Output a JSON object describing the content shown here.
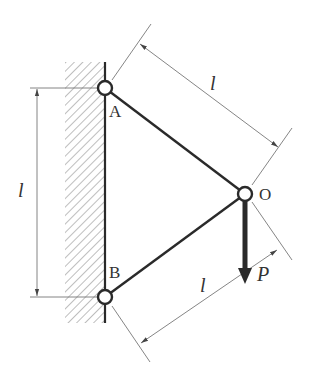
{
  "diagram": {
    "colors": {
      "member": "#2a2a2a",
      "dimension": "#777777",
      "hatch": "#888888",
      "text": "#333333",
      "background": "#ffffff"
    },
    "joints": [
      {
        "id": "A",
        "label": "A",
        "x": 105,
        "y": 88
      },
      {
        "id": "B",
        "label": "B",
        "x": 105,
        "y": 297
      },
      {
        "id": "O",
        "label": "O",
        "x": 245,
        "y": 194
      }
    ],
    "members": [
      {
        "from": "A",
        "to": "O"
      },
      {
        "from": "B",
        "to": "O"
      }
    ],
    "load": {
      "label": "P",
      "at": "O",
      "direction": "down"
    },
    "dimensions": [
      {
        "id": "dim-AB",
        "label": "l",
        "between": [
          "A",
          "B"
        ],
        "orientation": "vertical"
      },
      {
        "id": "dim-AO",
        "label": "l",
        "between": [
          "A",
          "O"
        ],
        "orientation": "aligned"
      },
      {
        "id": "dim-BO",
        "label": "l",
        "between": [
          "B",
          "O"
        ],
        "orientation": "aligned"
      }
    ],
    "support": {
      "type": "fixed-wall",
      "side": "left"
    }
  }
}
